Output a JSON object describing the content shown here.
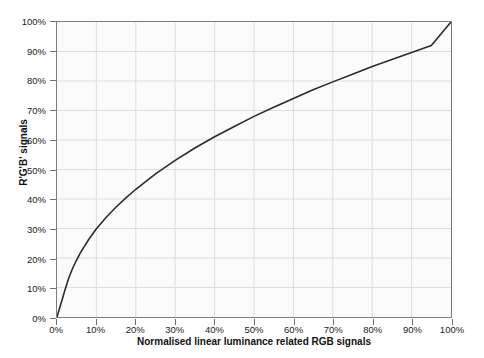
{
  "artifact": {
    "bleed_text": "scan bleed-through"
  },
  "chart_data": {
    "type": "line",
    "title": "",
    "xlabel": "Normalised linear luminance related RGB signals",
    "ylabel": "R'G'B' signals",
    "xlim": [
      0,
      100
    ],
    "ylim": [
      0,
      100
    ],
    "grid": true,
    "legend": "none",
    "x_tick_labels": [
      "0%",
      "10%",
      "20%",
      "30%",
      "40%",
      "50%",
      "60%",
      "70%",
      "80%",
      "90%",
      "100%"
    ],
    "y_tick_labels": [
      "0%",
      "10%",
      "20%",
      "30%",
      "40%",
      "50%",
      "60%",
      "70%",
      "80%",
      "90%",
      "100%"
    ],
    "x_ticks": [
      0,
      10,
      20,
      30,
      40,
      50,
      60,
      70,
      80,
      90,
      100
    ],
    "y_ticks": [
      0,
      10,
      20,
      30,
      40,
      50,
      60,
      70,
      80,
      90,
      100
    ],
    "series": [
      {
        "name": "R'G'B' transfer function (BT.709 OETF)",
        "color": "#2b2b2b",
        "width": 1.6,
        "x": [
          0,
          0.5,
          1,
          1.5,
          2,
          3,
          4,
          5,
          6,
          8,
          10,
          12.5,
          15,
          17.5,
          20,
          25,
          30,
          35,
          40,
          45,
          50,
          55,
          60,
          65,
          70,
          75,
          80,
          85,
          90,
          95,
          100
        ],
        "y": [
          0,
          2.3,
          4.5,
          6.8,
          9.1,
          13.3,
          16.6,
          19.4,
          21.9,
          26.2,
          29.9,
          33.8,
          37.3,
          40.4,
          43.3,
          48.5,
          53.1,
          57.3,
          61.1,
          64.6,
          68.0,
          71.1,
          74.1,
          77.0,
          79.7,
          82.3,
          84.9,
          87.3,
          89.7,
          92.0,
          100.0
        ]
      }
    ]
  }
}
